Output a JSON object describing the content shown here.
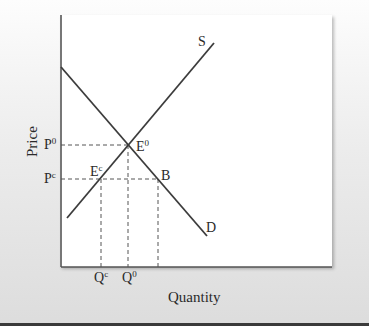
{
  "diagram": {
    "type": "supply-demand",
    "x_axis_title": "Quantity",
    "y_axis_title": "Price",
    "curves": {
      "supply": {
        "label": "S"
      },
      "demand": {
        "label": "D"
      }
    },
    "points": {
      "equilibrium": {
        "base": "E",
        "sup": "0"
      },
      "controlled": {
        "base": "E",
        "sup": "c"
      },
      "b": {
        "base": "B"
      }
    },
    "price_ticks": {
      "p0": {
        "base": "P",
        "sup": "0"
      },
      "pc": {
        "base": "P",
        "sup": "c"
      }
    },
    "quantity_ticks": {
      "q0": {
        "base": "Q",
        "sup": "0"
      },
      "qc": {
        "base": "Q",
        "sup": "c"
      }
    },
    "colors": {
      "line": "#3c3c3c",
      "dashed": "#555555",
      "plot_background": "#ffffff"
    }
  }
}
